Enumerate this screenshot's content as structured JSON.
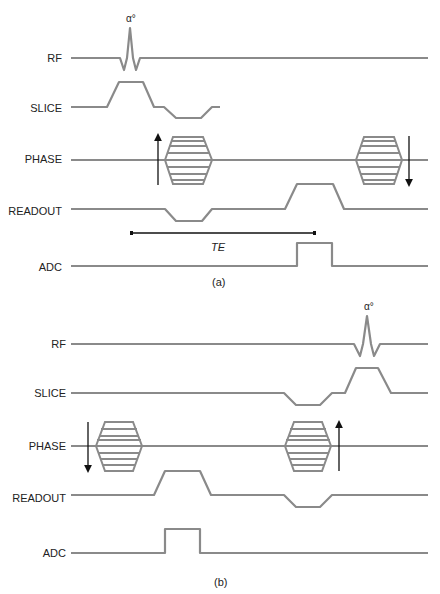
{
  "diagram": {
    "panels": [
      {
        "id": "a",
        "caption": "(a)",
        "rows": [
          "RF",
          "SLICE",
          "PHASE",
          "READOUT",
          "ADC"
        ],
        "rf_flip_label": "α°",
        "te_label": "TE"
      },
      {
        "id": "b",
        "caption": "(b)",
        "rows": [
          "RF",
          "SLICE",
          "PHASE",
          "READOUT",
          "ADC"
        ],
        "rf_flip_label": "α°"
      }
    ],
    "colors": {
      "waveform": "#8a8a8a",
      "arrow": "#111111",
      "text": "#222222"
    }
  }
}
